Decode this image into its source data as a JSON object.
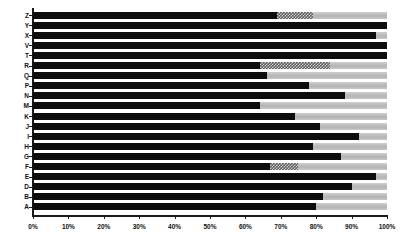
{
  "chart_data": {
    "type": "bar",
    "orientation": "horizontal",
    "stacked": true,
    "title": "",
    "subtitle": "",
    "xlabel": "",
    "ylabel": "",
    "xlim": [
      0,
      100
    ],
    "grid": false,
    "legend_position": "none",
    "axis_color": "#1a1a1a",
    "background": "#ffffff",
    "xticks": [
      "0%",
      "10%",
      "20%",
      "30%",
      "40%",
      "50%",
      "60%",
      "70%",
      "80%",
      "90%",
      "100%"
    ],
    "xtick_values": [
      0,
      10,
      20,
      30,
      40,
      50,
      60,
      70,
      80,
      90,
      100
    ],
    "categories": [
      "Z",
      "Y",
      "X",
      "V",
      "T",
      "R",
      "Q",
      "P",
      "N",
      "M",
      "K",
      "J",
      "I",
      "H",
      "G",
      "F",
      "E",
      "D",
      "B",
      "A"
    ],
    "series": [
      {
        "name": "series-1",
        "color": "#0d0d0d",
        "pattern": "solid",
        "values": [
          69,
          100,
          97,
          100,
          100,
          64,
          66,
          78,
          88,
          64,
          74,
          81,
          92,
          79,
          87,
          67,
          97,
          90,
          82,
          80
        ]
      },
      {
        "name": "series-2",
        "color": "#5a5a5a",
        "pattern": "checkered",
        "values": [
          10,
          0,
          0,
          0,
          0,
          20,
          0,
          0,
          0,
          0,
          0,
          0,
          0,
          0,
          0,
          8,
          0,
          0,
          0,
          0
        ]
      },
      {
        "name": "series-3",
        "color": "#bdbdbd",
        "pattern": "solid-light",
        "values": [
          21,
          0,
          3,
          0,
          0,
          16,
          34,
          22,
          12,
          36,
          26,
          19,
          8,
          21,
          13,
          25,
          3,
          10,
          18,
          20
        ]
      }
    ]
  }
}
